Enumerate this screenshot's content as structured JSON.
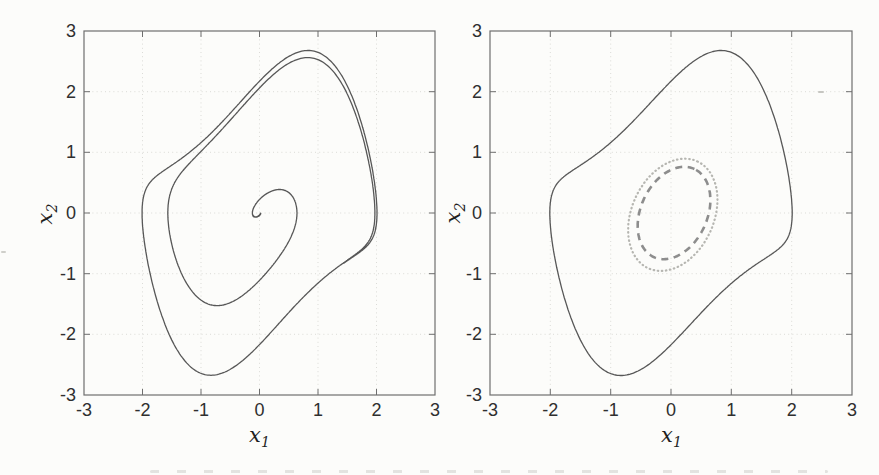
{
  "figure": {
    "background": "#fcfcfa",
    "frame_color": "#6e6e6e",
    "grid_color": "#dbdbd7",
    "tick_label_color": "#2f2f2f",
    "curve_color": "#575757",
    "dashed_color": "#8d8d8d",
    "dotted_color": "#b6b6b1"
  },
  "chart_data": [
    {
      "type": "line",
      "subtype": "phase-portrait",
      "title": "",
      "xlabel": "x_1",
      "ylabel": "x_2",
      "xlabel_base": "x",
      "xlabel_sub": "1",
      "ylabel_base": "x",
      "ylabel_sub": "2",
      "xlim": [
        -3,
        3
      ],
      "ylim": [
        -3,
        3
      ],
      "xticks": [
        -3,
        -2,
        -1,
        0,
        1,
        2,
        3
      ],
      "yticks": [
        -3,
        -2,
        -1,
        0,
        1,
        2,
        3
      ],
      "grid": "dotted",
      "legend": "none",
      "series": [
        {
          "name": "spiral-trajectory",
          "description": "Van der Pol oscillator trajectory spiraling outward from the origin onto the stable limit cycle",
          "generator": "van-der-pol",
          "mu": 1.0,
          "x0": [
            0.02,
            0.0
          ],
          "t_span": [
            0,
            20.4
          ],
          "dt": 0.01,
          "line": "solid",
          "color": "#575757",
          "width": 1.3
        }
      ]
    },
    {
      "type": "line",
      "subtype": "phase-portrait",
      "title": "",
      "xlabel": "x_1",
      "ylabel": "x_2",
      "xlabel_base": "x",
      "xlabel_sub": "1",
      "ylabel_base": "x",
      "ylabel_sub": "2",
      "xlim": [
        -3,
        3
      ],
      "ylim": [
        -3,
        3
      ],
      "xticks": [
        -3,
        -2,
        -1,
        0,
        1,
        2,
        3
      ],
      "yticks": [
        -3,
        -2,
        -1,
        0,
        1,
        2,
        3
      ],
      "grid": "dotted",
      "legend": "none",
      "series": [
        {
          "name": "limit-cycle",
          "description": "Van der Pol limit cycle",
          "generator": "van-der-pol",
          "mu": 1.0,
          "x0": [
            2.0086,
            0.0
          ],
          "t_span": [
            0,
            6.67
          ],
          "dt": 0.01,
          "line": "solid",
          "color": "#575757",
          "width": 1.3,
          "key_points": [
            [
              2.01,
              0.0
            ],
            [
              0.83,
              2.69
            ],
            [
              -2.01,
              0.0
            ],
            [
              -0.83,
              -2.69
            ]
          ]
        },
        {
          "name": "dashed-ellipse-estimate",
          "description": "Inner dashed elliptical level set around the origin",
          "generator": "ellipse",
          "center": [
            0.05,
            0.0
          ],
          "semi_major": 0.8,
          "semi_minor": 0.55,
          "rotation_deg": 65,
          "line": "dashed",
          "color": "#8d8d8d",
          "width": 2.6,
          "dash": [
            7,
            5.5
          ]
        },
        {
          "name": "dotted-ellipse-estimate",
          "description": "Outer dotted elliptical level set around the origin",
          "generator": "ellipse",
          "center": [
            0.03,
            -0.03
          ],
          "semi_major": 0.97,
          "semi_minor": 0.68,
          "rotation_deg": 65,
          "line": "dotted",
          "color": "#b6b6b1",
          "width": 2.2,
          "dash": [
            0.5,
            3.6
          ],
          "linecap": "round"
        }
      ]
    }
  ]
}
